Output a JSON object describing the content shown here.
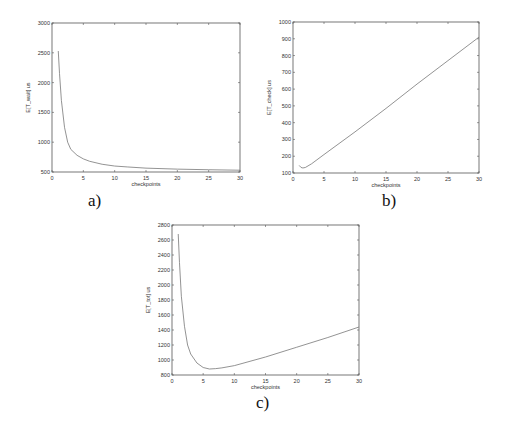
{
  "chart_data": [
    {
      "id": "a",
      "type": "line",
      "caption": "a)",
      "title": "",
      "xlabel": "checkpoints",
      "ylabel": "E[T_wait] us",
      "xlim": [
        0,
        30
      ],
      "ylim": [
        500,
        3000
      ],
      "xticks": [
        0,
        5,
        10,
        15,
        20,
        25,
        30
      ],
      "yticks": [
        500,
        1000,
        1500,
        2000,
        2500,
        3000
      ],
      "grid": false,
      "frame": {
        "left": 52,
        "top": 23,
        "right": 240,
        "bottom": 172
      },
      "x": [
        1,
        1.2,
        1.5,
        2,
        2.5,
        3,
        4,
        5,
        6,
        8,
        10,
        12,
        15,
        20,
        25,
        30
      ],
      "y": [
        2530,
        2150,
        1700,
        1250,
        1000,
        880,
        780,
        720,
        680,
        630,
        600,
        585,
        565,
        548,
        538,
        530
      ]
    },
    {
      "id": "b",
      "type": "line",
      "caption": "b)",
      "title": "",
      "xlabel": "checkpoints",
      "ylabel": "E[T_check] us",
      "xlim": [
        0,
        30
      ],
      "ylim": [
        100,
        1000
      ],
      "xticks": [
        0,
        5,
        10,
        15,
        20,
        25,
        30
      ],
      "yticks": [
        100,
        200,
        300,
        400,
        500,
        600,
        700,
        800,
        900,
        1000
      ],
      "grid": false,
      "frame": {
        "left": 293,
        "top": 22,
        "right": 479,
        "bottom": 173
      },
      "x": [
        1,
        1.3,
        1.6,
        2,
        3,
        5,
        10,
        15,
        20,
        25,
        30
      ],
      "y": [
        145,
        133,
        130,
        133,
        155,
        210,
        345,
        485,
        630,
        770,
        910
      ]
    },
    {
      "id": "c",
      "type": "line",
      "caption": "c)",
      "title": "",
      "xlabel": "checkpoints",
      "ylabel": "E[T_tot] us",
      "xlim": [
        0,
        30
      ],
      "ylim": [
        800,
        2800
      ],
      "xticks": [
        0,
        5,
        10,
        15,
        20,
        25,
        30
      ],
      "yticks": [
        800,
        1000,
        1200,
        1400,
        1600,
        1800,
        2000,
        2200,
        2400,
        2600,
        2800
      ],
      "grid": false,
      "frame": {
        "left": 172,
        "top": 225,
        "right": 359,
        "bottom": 375
      },
      "x": [
        1,
        1.2,
        1.5,
        2,
        2.5,
        3,
        4,
        5,
        6,
        7,
        8,
        10,
        15,
        20,
        25,
        30
      ],
      "y": [
        2680,
        2300,
        1850,
        1450,
        1200,
        1080,
        960,
        900,
        880,
        885,
        895,
        925,
        1040,
        1170,
        1300,
        1440
      ]
    }
  ]
}
